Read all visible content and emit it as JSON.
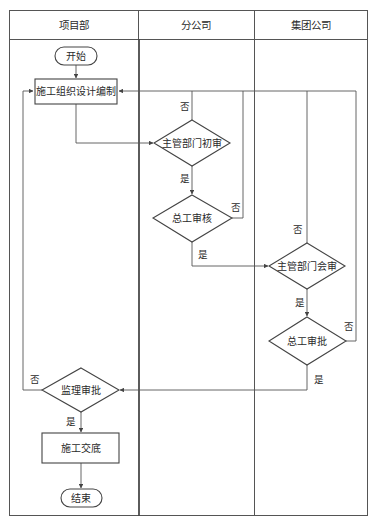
{
  "diagram": {
    "type": "swimlane-flowchart",
    "lanes": [
      {
        "id": "lane-project",
        "label": "项目部"
      },
      {
        "id": "lane-branch",
        "label": "分公司"
      },
      {
        "id": "lane-group",
        "label": "集团公司"
      }
    ],
    "nodes": [
      {
        "id": "start",
        "shape": "terminator",
        "label": "开始",
        "lane": "项目部"
      },
      {
        "id": "draft",
        "shape": "process",
        "label": "施工组织设计编制",
        "lane": "项目部"
      },
      {
        "id": "dept-initial-review",
        "shape": "decision",
        "label": "主管部门初审",
        "lane": "分公司"
      },
      {
        "id": "chief-eng-review",
        "shape": "decision",
        "label": "总工审核",
        "lane": "分公司"
      },
      {
        "id": "dept-joint-review",
        "shape": "decision",
        "label": "主管部门会审",
        "lane": "集团公司"
      },
      {
        "id": "chief-eng-approval",
        "shape": "decision",
        "label": "总工审批",
        "lane": "集团公司"
      },
      {
        "id": "supervisor-approval",
        "shape": "decision",
        "label": "监理审批",
        "lane": "项目部"
      },
      {
        "id": "handover",
        "shape": "process",
        "label": "施工交底",
        "lane": "项目部"
      },
      {
        "id": "end",
        "shape": "terminator",
        "label": "结束",
        "lane": "项目部"
      }
    ],
    "edges": [
      {
        "from": "start",
        "to": "draft",
        "label": ""
      },
      {
        "from": "draft",
        "to": "dept-initial-review",
        "label": ""
      },
      {
        "from": "dept-initial-review",
        "to": "draft",
        "label": "否"
      },
      {
        "from": "dept-initial-review",
        "to": "chief-eng-review",
        "label": "是"
      },
      {
        "from": "chief-eng-review",
        "to": "draft",
        "label": "否"
      },
      {
        "from": "chief-eng-review",
        "to": "dept-joint-review",
        "label": "是"
      },
      {
        "from": "dept-joint-review",
        "to": "draft",
        "label": "否"
      },
      {
        "from": "dept-joint-review",
        "to": "chief-eng-approval",
        "label": "是"
      },
      {
        "from": "chief-eng-approval",
        "to": "draft",
        "label": "否"
      },
      {
        "from": "chief-eng-approval",
        "to": "supervisor-approval",
        "label": "是"
      },
      {
        "from": "supervisor-approval",
        "to": "draft",
        "label": "否"
      },
      {
        "from": "supervisor-approval",
        "to": "handover",
        "label": "是"
      },
      {
        "from": "handover",
        "to": "end",
        "label": ""
      }
    ],
    "labels": {
      "no": "否",
      "yes": "是"
    }
  }
}
